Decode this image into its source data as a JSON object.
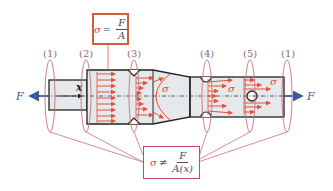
{
  "diagram": {
    "section_labels": [
      "(1)",
      "(2)",
      "(3)",
      "(4)",
      "(5)",
      "(1)"
    ],
    "stress_symbol": "σ",
    "force_left": "F",
    "force_right": "F",
    "axis_label": "x",
    "uniform_formula": {
      "lhs": "σ",
      "relation": "=",
      "numerator": "F",
      "denominator": "A"
    },
    "nonuniform_formula": {
      "lhs": "σ",
      "relation": "≠",
      "numerator": "F",
      "denominator": "A(x)"
    },
    "colors": {
      "stress_arrows": "#e8503a",
      "ellipse_stroke": "#c8707a",
      "callout_top_border": "#d0603a",
      "callout_bottom_border": "#c04a6a",
      "force_arrow": "#3a5aa0",
      "bar_fill": "#e6e9ec",
      "bar_outline": "#222222"
    }
  }
}
